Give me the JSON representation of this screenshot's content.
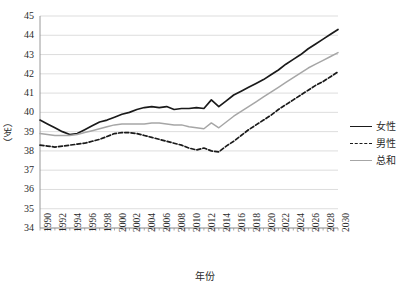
{
  "chart_data": {
    "type": "line",
    "title": "",
    "xlabel": "年份",
    "ylabel": "（岁）",
    "ylim": [
      34,
      45
    ],
    "yticks": [
      34,
      35,
      36,
      37,
      38,
      39,
      40,
      41,
      42,
      43,
      44,
      45
    ],
    "grid": true,
    "legend_position": "right",
    "x": [
      1990,
      1991,
      1992,
      1993,
      1994,
      1995,
      1996,
      1997,
      1998,
      1999,
      2000,
      2001,
      2002,
      2003,
      2004,
      2005,
      2006,
      2007,
      2008,
      2009,
      2010,
      2011,
      2012,
      2013,
      2014,
      2015,
      2016,
      2017,
      2018,
      2019,
      2020,
      2021,
      2022,
      2023,
      2024,
      2025,
      2026,
      2027,
      2028,
      2029,
      2030
    ],
    "xticks": [
      "1990",
      "1992",
      "1994",
      "1996",
      "1998",
      "2000",
      "2002",
      "2004",
      "2006",
      "2008",
      "2010",
      "2012",
      "2014",
      "2016",
      "2018",
      "2020",
      "2022",
      "2024",
      "2026",
      "2028",
      "2030"
    ],
    "series": [
      {
        "name": "女性",
        "style": "solid",
        "color": "#1a1a1a",
        "values": [
          39.6,
          39.4,
          39.2,
          39.0,
          38.85,
          38.9,
          39.1,
          39.3,
          39.5,
          39.6,
          39.75,
          39.9,
          40.0,
          40.15,
          40.25,
          40.3,
          40.25,
          40.3,
          40.15,
          40.2,
          40.2,
          40.25,
          40.2,
          40.65,
          40.3,
          40.6,
          40.9,
          41.1,
          41.3,
          41.5,
          41.7,
          41.95,
          42.2,
          42.5,
          42.75,
          43.0,
          43.3,
          43.55,
          43.8,
          44.05,
          44.3
        ]
      },
      {
        "name": "男性",
        "style": "dashed",
        "color": "#1a1a1a",
        "values": [
          38.3,
          38.25,
          38.2,
          38.25,
          38.3,
          38.35,
          38.4,
          38.5,
          38.6,
          38.75,
          38.9,
          38.95,
          38.95,
          38.9,
          38.8,
          38.7,
          38.6,
          38.5,
          38.4,
          38.3,
          38.15,
          38.05,
          38.15,
          38.0,
          37.95,
          38.25,
          38.5,
          38.8,
          39.1,
          39.35,
          39.6,
          39.85,
          40.15,
          40.4,
          40.65,
          40.9,
          41.15,
          41.4,
          41.6,
          41.85,
          42.1
        ]
      },
      {
        "name": "总和",
        "style": "solid",
        "color": "#a6a6a6",
        "values": [
          38.9,
          38.85,
          38.8,
          38.8,
          38.8,
          38.85,
          38.95,
          39.05,
          39.15,
          39.25,
          39.35,
          39.4,
          39.4,
          39.4,
          39.4,
          39.45,
          39.45,
          39.4,
          39.35,
          39.35,
          39.25,
          39.2,
          39.15,
          39.45,
          39.2,
          39.5,
          39.8,
          40.05,
          40.3,
          40.55,
          40.8,
          41.05,
          41.3,
          41.55,
          41.8,
          42.05,
          42.3,
          42.5,
          42.7,
          42.9,
          43.1
        ]
      }
    ]
  },
  "axis": {
    "x_title": "年份",
    "y_title": "（岁）"
  },
  "legend": {
    "items": [
      {
        "label": "女性"
      },
      {
        "label": "男性"
      },
      {
        "label": "总和"
      }
    ]
  }
}
